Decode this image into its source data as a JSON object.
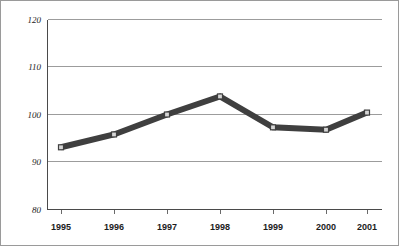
{
  "chart_data": {
    "type": "line",
    "title": "",
    "subtitle": "",
    "xlabel": "",
    "ylabel": "",
    "categories": [
      "1995",
      "1996",
      "1997",
      "1998",
      "1999",
      "2000",
      "2001"
    ],
    "values": [
      93.1,
      95.8,
      100.0,
      103.8,
      97.3,
      96.8,
      100.4
    ],
    "series": [
      {
        "name": "",
        "values": [
          93.1,
          95.8,
          100.0,
          103.8,
          97.3,
          96.8,
          100.4
        ]
      }
    ],
    "ylim": [
      80,
      120
    ],
    "yticks": [
      80,
      90,
      100,
      110,
      120
    ],
    "ytick_labels": [
      "80",
      "90",
      "100",
      "110",
      "120"
    ],
    "xtick_labels": [
      "1995",
      "1996",
      "1997",
      "1998",
      "1999",
      "2000",
      "2001"
    ],
    "grid": true,
    "grid_axis": "y",
    "legend": false,
    "legend_position": "none",
    "annotations": [],
    "colors": {
      "line": "#3f3f3f",
      "marker_fill": "#d6d6d6",
      "marker_stroke": "#3f3f3f",
      "gridline": "#9c9c9c",
      "axis": "#4a4a4a",
      "border": "#9a9a9a",
      "background": "#ffffff",
      "tick_label": "#1c1c1c"
    }
  }
}
